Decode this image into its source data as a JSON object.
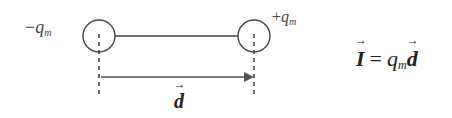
{
  "diagram": {
    "left_charge": {
      "sign": "−",
      "symbol": "q",
      "subscript": "m"
    },
    "right_charge": {
      "sign": "+",
      "symbol": "q",
      "subscript": "m"
    },
    "separation_vector_label": "d",
    "formula": {
      "lhs": "I",
      "equals": "=",
      "rhs_symbol": "q",
      "rhs_subscript": "m",
      "rhs_vector": "d"
    },
    "colors": {
      "stroke": "#444444",
      "background": "#ffffff"
    }
  }
}
